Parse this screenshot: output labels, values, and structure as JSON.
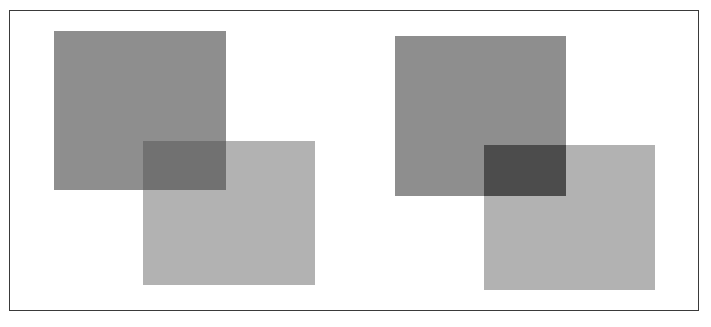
{
  "figure": {
    "frame": {
      "left": 9,
      "top": 10,
      "width": 690,
      "height": 301,
      "border_color": "#3a3a3a"
    },
    "panels": [
      {
        "name": "left-panel",
        "rects": [
          {
            "name": "dark-square",
            "x": 54,
            "y": 31,
            "w": 172,
            "h": 159,
            "color": "#8e8e8e"
          },
          {
            "name": "light-square",
            "x": 143,
            "y": 141,
            "w": 172,
            "h": 144,
            "color": "#b2b2b2"
          },
          {
            "name": "overlap",
            "x": 143,
            "y": 141,
            "w": 83,
            "h": 49,
            "color": "#717171"
          }
        ]
      },
      {
        "name": "right-panel",
        "rects": [
          {
            "name": "dark-square",
            "x": 395,
            "y": 36,
            "w": 171,
            "h": 160,
            "color": "#8e8e8e"
          },
          {
            "name": "light-square",
            "x": 484,
            "y": 145,
            "w": 171,
            "h": 145,
            "color": "#b2b2b2"
          },
          {
            "name": "overlap",
            "x": 484,
            "y": 145,
            "w": 82,
            "h": 51,
            "color": "#4c4c4c"
          }
        ]
      }
    ]
  }
}
